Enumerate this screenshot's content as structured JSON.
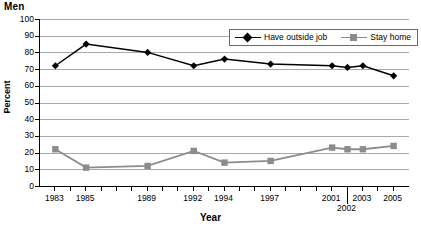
{
  "chart_data": {
    "type": "line",
    "title": "Men",
    "xlabel": "Year",
    "ylabel": "Percent",
    "ylim": [
      0,
      100
    ],
    "ytick_step": 10,
    "yticks": [
      100,
      90,
      80,
      70,
      60,
      50,
      40,
      30,
      20,
      10,
      0
    ],
    "categories": [
      1983,
      1985,
      1989,
      1992,
      1994,
      1997,
      2001,
      2002,
      2003,
      2005
    ],
    "xtick_labels": [
      "1983",
      "1985",
      "1989",
      "1992",
      "1994",
      "1997",
      "2001",
      "2002",
      "2003",
      "2005"
    ],
    "xlim": [
      1982,
      2006
    ],
    "grid": "horizontal",
    "legend_position": "top-right-inside",
    "series": [
      {
        "name": "Have outside job",
        "marker": "diamond",
        "color": "#000000",
        "values": [
          72,
          85,
          80,
          72,
          76,
          73,
          72,
          71,
          72,
          66
        ]
      },
      {
        "name": "Stay home",
        "marker": "square",
        "color": "#8c8c8c",
        "values": [
          22,
          11,
          12,
          21,
          14,
          15,
          23,
          22,
          22,
          24
        ]
      }
    ]
  },
  "legend": {
    "items": [
      {
        "label": "Have outside job"
      },
      {
        "label": "Stay home"
      }
    ]
  }
}
